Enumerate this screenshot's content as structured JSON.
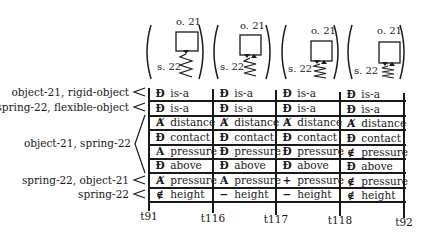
{
  "states": [
    {
      "object_label": "o. 21",
      "spring_label": "s. 22",
      "arrows": "down"
    },
    {
      "object_label": "o. 21",
      "spring_label": "s. 22",
      "arrows": "down-up"
    },
    {
      "object_label": "o. 21",
      "spring_label": "s. 22",
      "arrows": "down-up"
    },
    {
      "object_label": "o. 21",
      "spring_label": "s. 22",
      "arrows": "down-up"
    }
  ],
  "row_groups": [
    {
      "label": "object-21, rigid-object",
      "rows": 1,
      "bracket": "<"
    },
    {
      "label": "spring-22, flexible-object",
      "rows": 1,
      "bracket": "<"
    },
    {
      "label": "object-21, spring-22",
      "rows": 4,
      "bracket": "<"
    },
    {
      "label": "spring-22, object-21",
      "rows": 1,
      "bracket": "<"
    },
    {
      "label": "spring-22",
      "rows": 1,
      "bracket": "<"
    }
  ],
  "columns": [
    {
      "cells": [
        {
          "sym": "Ɖ",
          "rel": "is-a"
        },
        {
          "sym": "Ɖ",
          "rel": "is-a"
        },
        {
          "sym": "Ⱥ",
          "rel": "distance"
        },
        {
          "sym": "Ɖ",
          "rel": "contact"
        },
        {
          "sym": "A",
          "rel": "pressure"
        },
        {
          "sym": "Ɖ",
          "rel": "above"
        },
        {
          "sym": "Ⱥ",
          "rel": "pressure"
        },
        {
          "sym": "∉",
          "rel": "height"
        }
      ]
    },
    {
      "cells": [
        {
          "sym": "Ɖ",
          "rel": "is-a"
        },
        {
          "sym": "Ɖ",
          "rel": "is-a"
        },
        {
          "sym": "Ⱥ",
          "rel": "distance"
        },
        {
          "sym": "Ɖ",
          "rel": "contact"
        },
        {
          "sym": "Ɖ",
          "rel": "pressure"
        },
        {
          "sym": "Ɖ",
          "rel": "above"
        },
        {
          "sym": "A",
          "rel": "pressure"
        },
        {
          "sym": "−",
          "rel": "height"
        }
      ]
    },
    {
      "cells": [
        {
          "sym": "Ɖ",
          "rel": "is-a"
        },
        {
          "sym": "Ɖ",
          "rel": "is-a"
        },
        {
          "sym": "Ⱥ",
          "rel": "distance"
        },
        {
          "sym": "Ɖ",
          "rel": "contact"
        },
        {
          "sym": "Ɖ",
          "rel": "pressure"
        },
        {
          "sym": "Ɖ",
          "rel": "above"
        },
        {
          "sym": "+",
          "rel": "pressure"
        },
        {
          "sym": "−",
          "rel": "height"
        }
      ]
    },
    {
      "cells": [
        {
          "sym": "Ɖ",
          "rel": "is-a"
        },
        {
          "sym": "Ɖ",
          "rel": "is-a"
        },
        {
          "sym": "Ⱥ",
          "rel": "distance"
        },
        {
          "sym": "Ɖ",
          "rel": "contact"
        },
        {
          "sym": "∉",
          "rel": "pressure"
        },
        {
          "sym": "Ɖ",
          "rel": "above"
        },
        {
          "sym": "∉",
          "rel": "pressure"
        },
        {
          "sym": "∉",
          "rel": "height"
        }
      ]
    }
  ],
  "time_points": [
    "t91",
    "t116",
    "t117",
    "t118",
    "t92"
  ]
}
